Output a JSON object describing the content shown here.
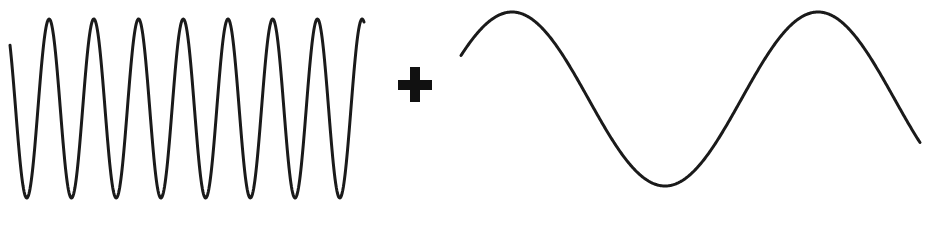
{
  "diagram": {
    "operator": "+",
    "operator_icon": "plus-icon",
    "stroke_color": "#1a1a1a",
    "operator_color": "#111111",
    "waves": [
      {
        "id": "high-frequency-wave",
        "cycles": 8,
        "relative_amplitude": 1.0,
        "start_phase_deg": 135,
        "end_phase_deg": 2985
      },
      {
        "id": "low-frequency-wave",
        "cycles": 1.5,
        "relative_amplitude": 1.0,
        "start_phase_deg": 30,
        "end_phase_deg": 570
      }
    ]
  }
}
